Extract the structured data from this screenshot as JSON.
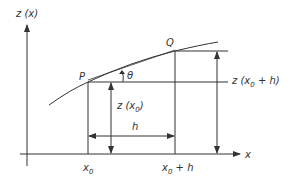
{
  "diagram": {
    "y_axis_label": "z (x)",
    "x_axis_label": "x",
    "point_p": "P",
    "point_q": "Q",
    "angle_label": "θ",
    "label_z_x0": {
      "main": "z (x",
      "sub": "0",
      "tail": ")"
    },
    "label_z_x0h": {
      "main": "z (x",
      "sub": "0",
      "tail": " + h)"
    },
    "label_h": "h",
    "tick_x0": {
      "main": "x",
      "sub": "0"
    },
    "tick_x0h": {
      "main": "x",
      "sub": "0",
      "tail": " + h"
    },
    "line_color": "#333333"
  }
}
